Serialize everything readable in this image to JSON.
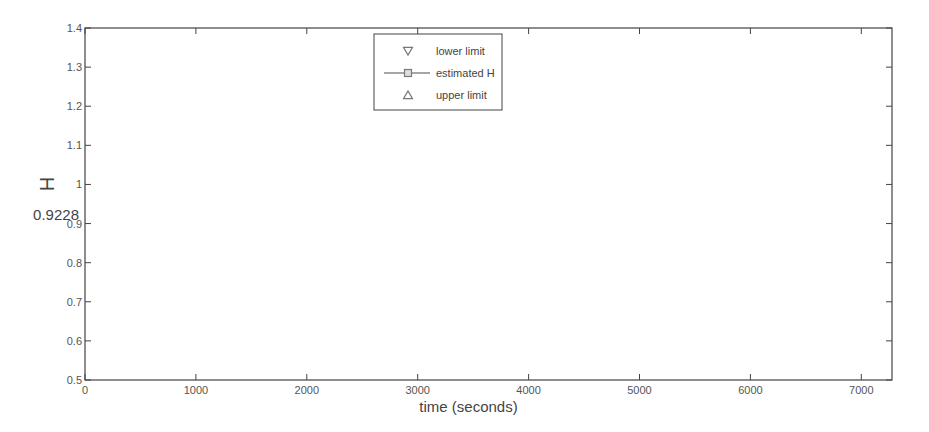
{
  "chart_data": {
    "type": "line",
    "title": "",
    "xlabel": "time (seconds)",
    "ylabel": "H",
    "xlim": [
      0,
      7300
    ],
    "ylim": [
      0.5,
      1.4
    ],
    "xticks": [
      0,
      1000,
      2000,
      3000,
      4000,
      5000,
      6000,
      7000
    ],
    "yticks": [
      0.5,
      0.6,
      0.7,
      0.8,
      0.9,
      1.0,
      1.1,
      1.2,
      1.3,
      1.4
    ],
    "ytick_labels": [
      "0.5",
      "0.6",
      "0.7",
      "0.8",
      "0.9",
      "1",
      "1.1",
      "1.2",
      "1.3",
      "1.4"
    ],
    "grid": false,
    "reference_line": {
      "value": 0.9228,
      "label": "0.9228"
    },
    "legend": {
      "position": "upper center",
      "entries": [
        "lower limit",
        "estimated H",
        "upper limit"
      ]
    },
    "x": [
      256,
      512,
      768,
      1024,
      1280,
      1536,
      1792,
      2048,
      2304,
      2560,
      2816,
      3072,
      3328,
      3584,
      3840,
      4096,
      4352,
      4608,
      4864,
      5120,
      5376,
      5632,
      5888,
      6144,
      6400,
      6656,
      6912,
      7168
    ],
    "series": [
      {
        "name": "lower limit",
        "marker": "triangle-down",
        "values": [
          0.67,
          0.65,
          0.64,
          0.78,
          0.635,
          0.69,
          0.81,
          0.995,
          0.92,
          0.825,
          0.73,
          0.605,
          0.69,
          0.67,
          0.84,
          0.685,
          0.85,
          0.815,
          0.795,
          0.715,
          0.79,
          0.635,
          0.77,
          0.87,
          0.865,
          0.97,
          0.655,
          0.71
        ]
      },
      {
        "name": "estimated H",
        "marker": "square",
        "values": [
          0.83,
          0.81,
          0.8,
          0.94,
          0.795,
          0.85,
          0.97,
          1.155,
          1.08,
          0.985,
          0.89,
          0.765,
          0.85,
          0.83,
          1.0,
          0.845,
          1.01,
          0.975,
          0.955,
          0.875,
          0.95,
          0.795,
          0.93,
          1.03,
          1.025,
          1.13,
          0.815,
          0.87
        ]
      },
      {
        "name": "upper limit",
        "marker": "triangle-up",
        "values": [
          0.99,
          0.97,
          0.955,
          1.1,
          0.955,
          1.01,
          1.13,
          1.315,
          1.24,
          1.145,
          1.05,
          0.925,
          1.01,
          0.99,
          1.16,
          1.005,
          1.17,
          1.135,
          1.115,
          1.035,
          1.11,
          0.955,
          1.09,
          1.19,
          1.185,
          1.29,
          0.975,
          1.03
        ]
      }
    ]
  },
  "colors": {
    "axis": "#444444",
    "series_line": "#888888",
    "marker": "#777777",
    "errorbar": "#333333",
    "reference_line": "#999999"
  }
}
